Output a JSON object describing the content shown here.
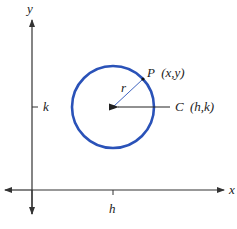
{
  "diagram": {
    "type": "circle-center-radius",
    "axes": {
      "x_label": "x",
      "y_label": "y"
    },
    "ticks": {
      "h_label": "h",
      "k_label": "k"
    },
    "circle": {
      "center_label_letter": "C",
      "center_label_coords": "(h,k)",
      "point_label_letter": "P",
      "point_label_coords": "(x,y)",
      "radius_label": "r",
      "stroke_color": "#2a52b8"
    },
    "colors": {
      "axis": "#333333",
      "circle": "#2a52b8"
    }
  }
}
